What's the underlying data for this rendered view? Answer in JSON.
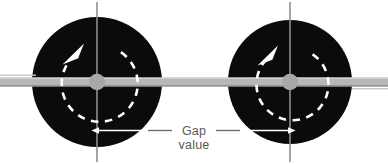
{
  "figure": {
    "type": "technical-diagram",
    "background_color": "#ffffff",
    "width": 388,
    "height": 164
  },
  "annotation": {
    "label_line_1": "Gap",
    "label_line_2": "value",
    "text_color": "#5a5a5a",
    "arrow_direction_left": "left",
    "arrow_direction_right": "right",
    "measures_from": "left-disc-center-line",
    "measures_to": "right-disc-center-line"
  },
  "colors": {
    "disc_fill": "#0b0b0b",
    "shaft_fill": "#b7b7b7",
    "shaft_edge": "#8c8c8c",
    "hub_fill": "#a8a8a8",
    "center_line": "#8e8e8e",
    "dashed_circle": "#ffffff",
    "rotation_arrow": "#ffffff",
    "dimension_line": "#6e6e6e"
  },
  "discs": [
    {
      "name": "left-disc",
      "center_x": 97,
      "center_y": 82,
      "radius": 65,
      "hub_radius": 8,
      "rotation_circle_radius": 38,
      "rotation_direction": "counterclockwise",
      "has_vertical_center_line": true,
      "has_horizontal_center_line": true
    },
    {
      "name": "right-disc",
      "center_x": 290,
      "center_y": 82,
      "radius": 62,
      "hub_radius": 8,
      "rotation_circle_radius": 36,
      "rotation_direction": "counterclockwise",
      "has_vertical_center_line": true,
      "has_horizontal_center_line": true
    }
  ],
  "shaft": {
    "name": "shaft",
    "y_center": 82,
    "thickness": 9,
    "x_start": 0,
    "x_end": 388
  }
}
